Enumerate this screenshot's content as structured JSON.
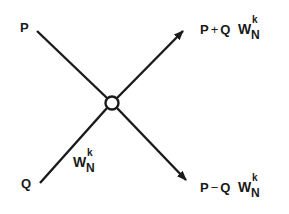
{
  "diagram": {
    "type": "butterfly",
    "inputs": {
      "top": "P",
      "bottom": "Q"
    },
    "twiddle": {
      "base": "W",
      "superscript": "k",
      "subscript": "N"
    },
    "outputs": {
      "top": {
        "p": "P",
        "op": "+",
        "q": "Q",
        "w": "W",
        "sup": "k",
        "sub": "N"
      },
      "bottom": {
        "p": "P",
        "op": "−",
        "q": "Q",
        "w": "W",
        "sup": "k",
        "sub": "N"
      }
    },
    "node": "summing-node",
    "colors": {
      "stroke": "#1a1a1a",
      "background": "#ffffff"
    }
  }
}
